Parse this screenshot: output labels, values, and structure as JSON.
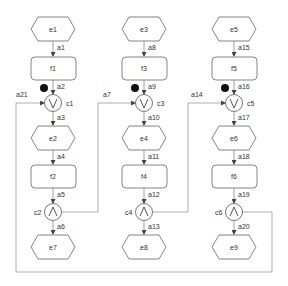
{
  "diagram": {
    "columns": [
      {
        "start_event": "e1",
        "arc_in": "a1",
        "function1": "f1",
        "arc_token": "a2",
        "xor_join": "c1",
        "xor_symbol": "V",
        "arc_out_join": "a3",
        "mid_event": "e2",
        "arc_f2": "a4",
        "function2": "f2",
        "arc_and": "a5",
        "and_split": "c2",
        "and_symbol": "Λ",
        "arc_end": "a6",
        "end_event": "e7"
      },
      {
        "start_event": "e3",
        "arc_in": "a8",
        "function1": "f3",
        "arc_token": "a9",
        "xor_join": "c3",
        "xor_symbol": "V",
        "arc_out_join": "a10",
        "mid_event": "e4",
        "arc_f2": "a11",
        "function2": "f4",
        "arc_and": "a12",
        "and_split": "c4",
        "and_symbol": "Λ",
        "arc_end": "a13",
        "end_event": "e8"
      },
      {
        "start_event": "e5",
        "arc_in": "a15",
        "function1": "f5",
        "arc_token": "a16",
        "xor_join": "c5",
        "xor_symbol": "V",
        "arc_out_join": "a17",
        "mid_event": "e6",
        "arc_f2": "a18",
        "function2": "f6",
        "arc_and": "a19",
        "and_split": "c6",
        "and_symbol": "Λ",
        "arc_end": "a20",
        "end_event": "e9"
      }
    ],
    "feedback_arcs": {
      "c6_to_c1": "a21",
      "c2_to_c3": "a7",
      "c4_to_c5": "a14"
    },
    "colors": {
      "stroke": "#777777",
      "token": "#111111",
      "background": "#ffffff"
    }
  }
}
